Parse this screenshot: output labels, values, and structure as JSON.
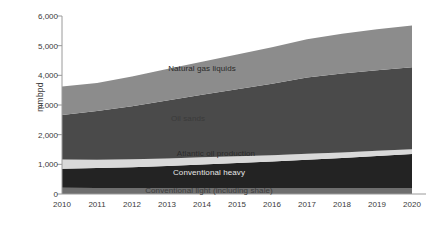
{
  "chart_data": {
    "type": "area",
    "stacked": true,
    "title": "",
    "subtitle": "",
    "xlabel": "",
    "ylabel": "mmbpd",
    "x": [
      2010,
      2011,
      2012,
      2013,
      2014,
      2015,
      2016,
      2017,
      2018,
      2019,
      2020
    ],
    "categories": [
      "2010",
      "2011",
      "2012",
      "2013",
      "2014",
      "2015",
      "2016",
      "2017",
      "2018",
      "2019",
      "2020"
    ],
    "xtick_labels": [
      "2010",
      "2011",
      "2012",
      "2013",
      "2014",
      "2015",
      "2016",
      "2017",
      "2018",
      "2019",
      "2020"
    ],
    "ytick_labels": [
      "0",
      "1,000",
      "2,000",
      "3,000",
      "4,000",
      "5,000",
      "6,000"
    ],
    "ytick_values": [
      0,
      1000,
      2000,
      3000,
      4000,
      5000,
      6000
    ],
    "ylim": [
      0,
      6000
    ],
    "xlim": [
      2010,
      2020
    ],
    "grid": false,
    "legend": "inline-labels",
    "series": [
      {
        "name": "Conventional light (including shale)",
        "color": "#6e6e6e",
        "values": [
          210,
          205,
          205,
          205,
          205,
          205,
          205,
          205,
          205,
          205,
          205
        ]
      },
      {
        "name": "Conventional heavy",
        "color": "#232323",
        "values": [
          640,
          670,
          700,
          740,
          790,
          840,
          890,
          950,
          1010,
          1080,
          1145
        ]
      },
      {
        "name": "Atlantic oil production",
        "color": "#d9d9d9",
        "values": [
          310,
          280,
          265,
          250,
          240,
          230,
          215,
          200,
          185,
          170,
          160
        ]
      },
      {
        "name": "Oil sands",
        "color": "#4a4a4a",
        "values": [
          1500,
          1640,
          1790,
          1960,
          2110,
          2260,
          2410,
          2570,
          2660,
          2715,
          2760
        ]
      },
      {
        "name": "Natural gas liquids",
        "color": "#8c8c8c",
        "values": [
          960,
          950,
          1000,
          1060,
          1110,
          1170,
          1230,
          1290,
          1340,
          1380,
          1410
        ]
      }
    ],
    "totals": [
      3620,
      3745,
      3960,
      4215,
      4455,
      4705,
      4950,
      5215,
      5400,
      5550,
      5680
    ],
    "inline_labels": [
      {
        "text": "Natural gas liquids",
        "x": 2014.0,
        "y": 4240,
        "color": "#2a2a2a"
      },
      {
        "text": "Oil sands",
        "x": 2013.6,
        "y": 2560,
        "color": "#3a3a3a"
      },
      {
        "text": "Atlantic oil production",
        "x": 2014.4,
        "y": 1380,
        "color": "#2a2a2a"
      },
      {
        "text": "Conventional heavy",
        "x": 2014.2,
        "y": 750,
        "color": "#e8e8e8"
      },
      {
        "text": "Conventional light (including shale)",
        "x": 2014.2,
        "y": 125,
        "color": "#3c3c3c"
      }
    ],
    "axis_color": "#9a9a9a",
    "text_color": "#3a3a3a",
    "background": "#ffffff"
  }
}
